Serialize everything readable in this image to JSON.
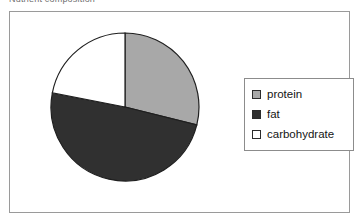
{
  "caption": {
    "text": "Nutrient composition"
  },
  "chart_data": {
    "type": "pie",
    "title": "",
    "subtitle": "",
    "xlabel": "",
    "ylabel": "",
    "grid": false,
    "legend_position": "right",
    "start_angle_deg": 0,
    "direction": "clockwise",
    "categories": [
      "protein",
      "fat",
      "carbohydrate"
    ],
    "values": [
      29,
      49,
      22
    ],
    "units": "percent",
    "colors": [
      "#a8a8a8",
      "#303030",
      "#ffffff"
    ],
    "slices": [
      {
        "label": "protein",
        "value": 29,
        "color": "#a8a8a8",
        "start_deg": 0,
        "end_deg": 104
      },
      {
        "label": "fat",
        "value": 49,
        "color": "#303030",
        "start_deg": 104,
        "end_deg": 281
      },
      {
        "label": "carbohydrate",
        "value": 22,
        "color": "#ffffff",
        "start_deg": 281,
        "end_deg": 360
      }
    ],
    "geometry": {
      "center_x": 76,
      "center_y": 76,
      "radius": 74
    },
    "stroke_color": "#1f1f1f"
  },
  "legend": {
    "items": [
      {
        "label": "protein",
        "swatch": "#a8a8a8"
      },
      {
        "label": "fat",
        "swatch": "#303030"
      },
      {
        "label": "carbohydrate",
        "swatch": "#ffffff"
      }
    ]
  }
}
